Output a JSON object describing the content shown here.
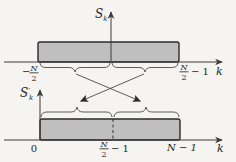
{
  "colors": {
    "background": "#f5f4f1",
    "rect_fill": "#bfbfbf",
    "rect_stroke": "#2b2b2b",
    "line": "#3a3a3a"
  },
  "top_plot": {
    "y_axis_label": {
      "main": "S",
      "sub": "k"
    },
    "x_axis_label": "k",
    "left_tick": {
      "sign": "−",
      "frac_num": "N",
      "frac_den": "2"
    },
    "right_tick": {
      "frac_num": "N",
      "frac_den": "2",
      "suffix": "− 1"
    }
  },
  "bottom_plot": {
    "y_axis_label": {
      "main": "S",
      "prime": "′",
      "sub": "k"
    },
    "x_axis_label": "k",
    "origin_tick": "0",
    "mid_tick": {
      "frac_num": "N",
      "frac_den": "2",
      "suffix": "− 1"
    },
    "right_tick": "N − 1"
  }
}
